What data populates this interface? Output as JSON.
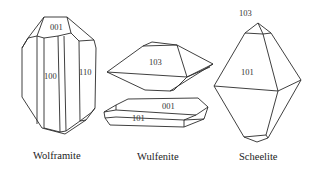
{
  "figure": {
    "crystals": [
      {
        "name": "Wolframite",
        "faces": [
          "001",
          "100",
          "110"
        ]
      },
      {
        "name": "Wulfenite",
        "faces": [
          "103",
          "001",
          "101"
        ]
      },
      {
        "name": "Scheelite",
        "faces": [
          "103",
          "101"
        ]
      }
    ]
  },
  "colors": {
    "line": "#2a2a2a",
    "background": "#ffffff"
  }
}
